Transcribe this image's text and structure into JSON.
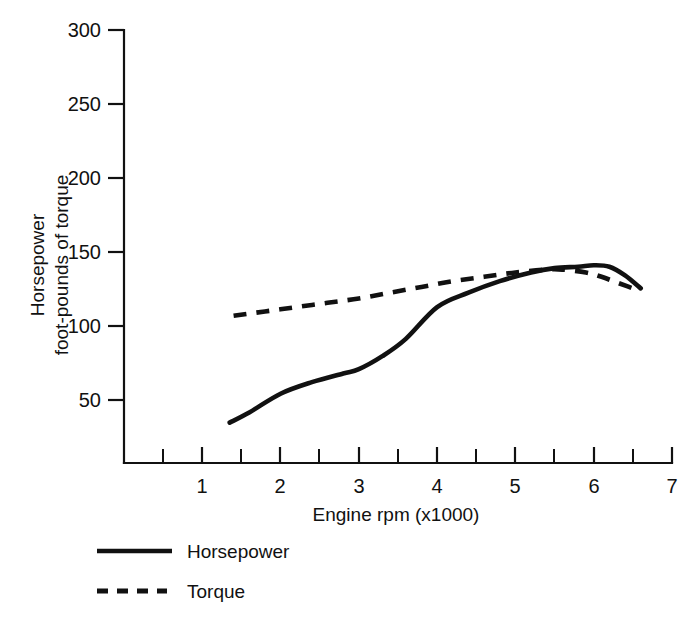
{
  "chart_data": {
    "type": "line",
    "title": "",
    "subtitle": "",
    "xlabel": "Engine rpm (x1000)",
    "ylabel_line1": "Horsepower",
    "ylabel_line2": "foot-pounds of torque",
    "xlim": [
      0,
      7
    ],
    "ylim": [
      0,
      300
    ],
    "grid": false,
    "legend_position": "below-plot-left",
    "x_ticks_major": [
      1,
      2,
      3,
      4,
      5,
      6,
      7
    ],
    "x_tick_labels": [
      "1",
      "2",
      "3",
      "4",
      "5",
      "6",
      "7"
    ],
    "x_ticks_minor": [
      0.5,
      1.5,
      2.5,
      3.5,
      4.5,
      5.5,
      6.5
    ],
    "y_ticks_major": [
      50,
      100,
      150,
      200,
      250,
      300
    ],
    "y_tick_labels": [
      "50",
      "100",
      "150",
      "200",
      "250",
      "300"
    ],
    "series": [
      {
        "name": "Horsepower",
        "style": "solid",
        "color": "#111111",
        "x": [
          1.35,
          1.6,
          2.0,
          2.4,
          2.8,
          3.0,
          3.3,
          3.6,
          4.0,
          4.4,
          4.8,
          5.2,
          5.5,
          5.8,
          6.0,
          6.2,
          6.4,
          6.6
        ],
        "y": [
          28,
          35,
          48,
          56,
          62,
          65,
          74,
          86,
          108,
          118,
          126,
          132,
          135,
          136,
          137,
          136,
          130,
          121
        ]
      },
      {
        "name": "Torque",
        "style": "dashed",
        "color": "#111111",
        "x": [
          1.4,
          1.8,
          2.2,
          2.6,
          3.0,
          3.4,
          3.8,
          4.2,
          4.6,
          5.0,
          5.4,
          5.6,
          5.9,
          6.1,
          6.3,
          6.6
        ],
        "y": [
          102,
          105,
          108,
          111,
          114,
          118,
          122,
          126,
          129,
          132,
          134,
          134,
          132,
          129,
          125,
          119
        ]
      }
    ],
    "legend": [
      {
        "label": "Horsepower",
        "style": "solid"
      },
      {
        "label": "Torque",
        "style": "dashed"
      }
    ]
  },
  "axis": {
    "x_label": "Engine rpm (x1000)",
    "y_label_line1": "Horsepower",
    "y_label_line2": "foot-pounds of torque"
  },
  "ticks": {
    "y": [
      "300",
      "250",
      "200",
      "150",
      "100",
      "50"
    ],
    "x": [
      "1",
      "2",
      "3",
      "4",
      "5",
      "6",
      "7"
    ]
  },
  "legend": {
    "item1_label": "Horsepower",
    "item2_label": "Torque"
  },
  "colors": {
    "ink": "#111111",
    "background": "#ffffff"
  }
}
